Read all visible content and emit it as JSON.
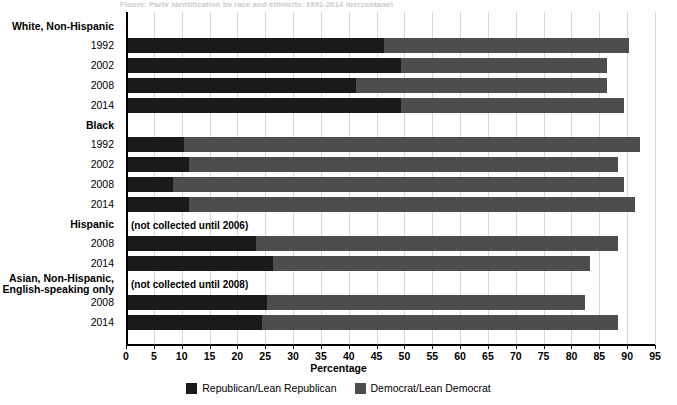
{
  "top_caption": "Figure: Party identification by race and ethnicity, 1992-2014 (percentage)",
  "axis": {
    "xlabel": "Percentage",
    "xticks": [
      0,
      5,
      10,
      15,
      20,
      25,
      30,
      35,
      40,
      45,
      50,
      55,
      60,
      65,
      70,
      75,
      80,
      85,
      90,
      95
    ],
    "xmin": 0,
    "xmax": 95
  },
  "legend": {
    "position": "bottom-center",
    "entries": [
      {
        "label": "Republican/Lean Republican",
        "color": "#1a1a1a"
      },
      {
        "label": "Democrat/Lean Democrat",
        "color": "#4d4d4d"
      }
    ]
  },
  "notes": {
    "hispanic": "(not collected until 2006)",
    "asian": "(not collected until 2008)"
  },
  "groups": [
    {
      "heading": "White, Non-Hispanic",
      "heading_lines": [
        "White, Non-Hispanic"
      ],
      "note": null,
      "rows": [
        {
          "year": "1992",
          "republican": 46,
          "democrat": 44,
          "total": 90
        },
        {
          "year": "2002",
          "republican": 49,
          "democrat": 37,
          "total": 86
        },
        {
          "year": "2008",
          "republican": 41,
          "democrat": 45,
          "total": 86
        },
        {
          "year": "2014",
          "republican": 49,
          "democrat": 40,
          "total": 89
        }
      ]
    },
    {
      "heading": "Black",
      "heading_lines": [
        "Black"
      ],
      "note": null,
      "rows": [
        {
          "year": "1992",
          "republican": 10,
          "democrat": 82,
          "total": 92
        },
        {
          "year": "2002",
          "republican": 11,
          "democrat": 77,
          "total": 88
        },
        {
          "year": "2008",
          "republican": 8,
          "democrat": 81,
          "total": 89
        },
        {
          "year": "2014",
          "republican": 11,
          "democrat": 80,
          "total": 91
        }
      ]
    },
    {
      "heading": "Hispanic",
      "heading_lines": [
        "Hispanic"
      ],
      "note": "(not collected until 2006)",
      "rows": [
        {
          "year": "2008",
          "republican": 23,
          "democrat": 65,
          "total": 88
        },
        {
          "year": "2014",
          "republican": 26,
          "democrat": 57,
          "total": 83
        }
      ]
    },
    {
      "heading": "Asian, Non-Hispanic, English-speaking only",
      "heading_lines": [
        "Asian, Non-Hispanic,",
        "English-speaking only"
      ],
      "note": "(not collected until 2008)",
      "rows": [
        {
          "year": "2008",
          "republican": 25,
          "democrat": 57,
          "total": 82
        },
        {
          "year": "2014",
          "republican": 24,
          "democrat": 64,
          "total": 88
        }
      ]
    }
  ],
  "chart_data": {
    "type": "bar",
    "orientation": "horizontal",
    "stacked": true,
    "title": "",
    "xlabel": "Percentage",
    "ylabel": "",
    "xlim": [
      0,
      95
    ],
    "grid": "vertical",
    "legend_position": "bottom-center",
    "categories": [
      "White, Non-Hispanic 1992",
      "White, Non-Hispanic 2002",
      "White, Non-Hispanic 2008",
      "White, Non-Hispanic 2014",
      "Black 1992",
      "Black 2002",
      "Black 2008",
      "Black 2014",
      "Hispanic 2008",
      "Hispanic 2014",
      "Asian, Non-Hispanic, English-speaking only 2008",
      "Asian, Non-Hispanic, English-speaking only 2014"
    ],
    "series": [
      {
        "name": "Republican/Lean Republican",
        "color": "#1a1a1a",
        "values": [
          46,
          49,
          41,
          49,
          10,
          11,
          8,
          11,
          23,
          26,
          25,
          24
        ]
      },
      {
        "name": "Democrat/Lean Democrat",
        "color": "#4d4d4d",
        "values": [
          44,
          37,
          45,
          40,
          82,
          77,
          81,
          80,
          65,
          57,
          57,
          64
        ]
      }
    ],
    "totals": [
      90,
      86,
      86,
      89,
      92,
      88,
      89,
      91,
      88,
      83,
      82,
      88
    ],
    "annotations": [
      {
        "text": "(not collected until 2006)",
        "group": "Hispanic"
      },
      {
        "text": "(not collected until 2008)",
        "group": "Asian, Non-Hispanic, English-speaking only"
      }
    ]
  }
}
